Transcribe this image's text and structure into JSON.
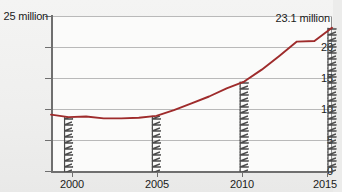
{
  "chart_data": {
    "type": "line",
    "title": "",
    "xlabel": "",
    "ylabel": "",
    "y_axis_unit_label": "25 million",
    "xlim": [
      1999,
      2015
    ],
    "ylim": [
      0,
      25
    ],
    "y_ticks": [
      0,
      5,
      10,
      15,
      20,
      25
    ],
    "y_tick_labels": [
      "0",
      "5",
      "10",
      "15",
      "20",
      "25 million"
    ],
    "x_ticks": [
      2000,
      2005,
      2010,
      2015
    ],
    "x_tick_labels": [
      "2000",
      "2005",
      "2010",
      "2015"
    ],
    "grid": true,
    "legend": "none",
    "series": [
      {
        "name": "value",
        "color": "#9e2b2b",
        "x": [
          1999,
          2000,
          2001,
          2002,
          2003,
          2004,
          2005,
          2006,
          2007,
          2008,
          2009,
          2010,
          2011,
          2012,
          2013,
          2014,
          2015
        ],
        "values": [
          9.2,
          8.8,
          8.9,
          8.6,
          8.6,
          8.7,
          9.0,
          9.9,
          11.0,
          12.1,
          13.4,
          14.5,
          16.4,
          18.6,
          20.9,
          21.0,
          23.1
        ]
      }
    ],
    "annotations": [
      {
        "text": "23.1 million",
        "x": 2015,
        "y": 23.1
      }
    ],
    "markers": {
      "type": "hatched-measure-bar",
      "at_years": [
        2000,
        2005,
        2010,
        2015
      ]
    }
  },
  "axis": {
    "y_label_25": "25 million",
    "y_label_20": "20",
    "y_label_15": "15",
    "y_label_10": "10",
    "y_label_5": "5",
    "y_label_0": "0",
    "x_label_2000": "2000",
    "x_label_2005": "2005",
    "x_label_2010": "2010",
    "x_label_2015": "2015"
  },
  "annotation": {
    "peak_value_label": "23.1 million"
  },
  "colors": {
    "line": "#9e2b2b",
    "axis": "#6f6f6f",
    "grid": "#b9b9b9",
    "text": "#1b1b1b",
    "plot_background": "#fbfbfa",
    "page_background": "#f2f2f1",
    "hatch": "#4a4a4a"
  }
}
